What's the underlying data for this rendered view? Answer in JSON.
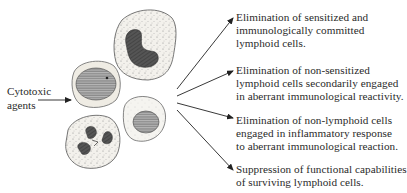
{
  "input": {
    "label_line1": "Cytotoxic",
    "label_line2": "agents"
  },
  "cells": [
    {
      "type": "monocyte",
      "position": "top"
    },
    {
      "type": "lymphocyte-large",
      "position": "middle-left"
    },
    {
      "type": "lymphocyte-small",
      "position": "middle-right"
    },
    {
      "type": "neutrophil",
      "position": "bottom"
    }
  ],
  "outcomes": [
    {
      "lines": [
        "Elimination of sensitized and",
        "immunologically committed",
        "lymphoid cells."
      ]
    },
    {
      "lines": [
        "Elimination of non-sensitized",
        "lymphoid cells secondarily engaged",
        "in aberrant immunological reactivity."
      ]
    },
    {
      "lines": [
        "Elimination of non-lymphoid cells",
        "engaged in inflammatory response",
        "to aberrant immunological reaction."
      ]
    },
    {
      "lines": [
        "Suppression of functional capabilities",
        "of surviving lymphoid cells."
      ]
    }
  ],
  "colors": {
    "line": "#222222",
    "cytoplasm": "#f1efe9",
    "nucleus": "#555555"
  }
}
